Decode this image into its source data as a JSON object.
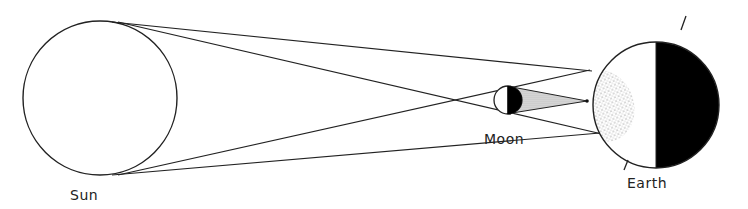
{
  "diagram": {
    "labels": {
      "sun": "Sun",
      "moon": "Moon",
      "earth": "Earth"
    },
    "bodies": {
      "sun": {
        "cx": 100,
        "cy": 98,
        "r": 77
      },
      "moon": {
        "cx": 508,
        "cy": 100,
        "r": 14
      },
      "earth": {
        "cx": 656,
        "cy": 105,
        "r": 63
      }
    },
    "colors": {
      "stroke": "#222222",
      "dark_side": "#000000",
      "umbra_fill": "#cfcfcf",
      "background": "#ffffff"
    }
  }
}
